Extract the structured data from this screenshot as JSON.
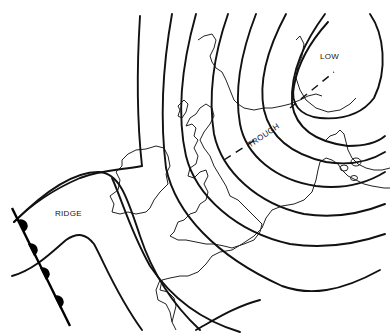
{
  "diagram": {
    "type": "synoptic weather chart",
    "colors": {
      "ink": "#111111",
      "background": "#ffffff"
    },
    "labels": {
      "low": "LOW",
      "trough": "TROUGH",
      "ridge": "RIDGE"
    },
    "features": [
      {
        "name": "low-pressure-centre",
        "label": "LOW"
      },
      {
        "name": "trough-axis",
        "style": "dashed line"
      },
      {
        "name": "ridge",
        "label": "RIDGE"
      },
      {
        "name": "warm-front",
        "style": "line with semicircle markers"
      },
      {
        "name": "isobars",
        "count": 9
      },
      {
        "name": "coastlines",
        "region": "British Isles and NW Europe"
      }
    ]
  }
}
